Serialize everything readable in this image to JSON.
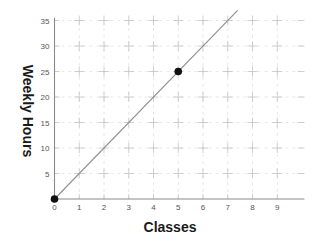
{
  "chart_data": {
    "type": "line",
    "title": "",
    "xlabel": "Classes",
    "ylabel": "Weekly Hours",
    "xlim": [
      0,
      10.1
    ],
    "ylim": [
      0,
      35.5
    ],
    "x_ticks": [
      0,
      1,
      2,
      3,
      4,
      5,
      6,
      7,
      8,
      9
    ],
    "y_ticks": [
      5,
      10,
      15,
      20,
      25,
      30,
      35
    ],
    "grid": true,
    "legend": "none",
    "series": [
      {
        "name": "line",
        "x": [
          0,
          7.4
        ],
        "y": [
          0,
          37
        ],
        "color": "#8f8f8f"
      }
    ],
    "points": [
      {
        "x": 0,
        "y": 0
      },
      {
        "x": 5,
        "y": 25
      }
    ],
    "point_color": "#111111"
  }
}
